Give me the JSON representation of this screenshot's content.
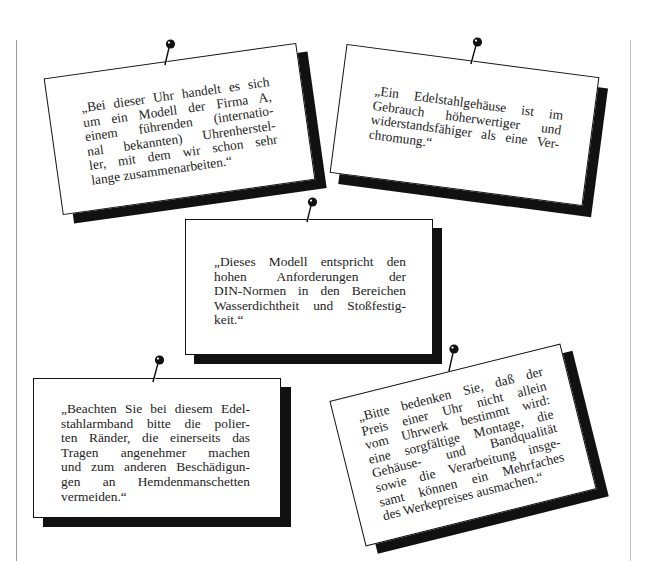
{
  "cards": [
    {
      "id": "card-1",
      "lines": [
        "„Bei dieser Uhr handelt es sich",
        "um ein Modell der Firma A,",
        "einem führenden (internatio-",
        "nal bekannten) Uhrenherstel-",
        "ler, mit dem wir schon sehr",
        "lange zusammenarbeiten.“"
      ]
    },
    {
      "id": "card-2",
      "lines": [
        "„Ein Edelstahlgehäuse ist im",
        "Gebrauch höherwertiger und",
        "widerstandsfähiger als eine Ver-",
        "chromung.“"
      ]
    },
    {
      "id": "card-3",
      "lines": [
        "„Dieses Modell entspricht den",
        "hohen Anforderungen der",
        "DIN-Normen in den Bereichen",
        "Wasserdichtheit und Stoßfestig-",
        "keit.“"
      ]
    },
    {
      "id": "card-4",
      "lines": [
        "„Beachten Sie bei diesem Edel-",
        "stahlarmband bitte die polier-",
        "ten Ränder, die einerseits das",
        "Tragen angenehmer machen",
        "und zum anderen Beschädigun-",
        "gen an Hemdenmanschetten",
        "vermeiden.“"
      ]
    },
    {
      "id": "card-5",
      "lines": [
        "„Bitte bedenken Sie, daß der",
        "Preis einer Uhr nicht allein",
        "vom Uhrwerk bestimmt wird:",
        "eine sorgfältige Montage, die",
        "Gehäuse- und Bandqualität",
        "sowie die Verarbeitung insge-",
        "samt können ein Mehrfaches",
        "des Werkepreises ausmachen.“"
      ]
    }
  ],
  "icons": {
    "pin": "push-pin-icon"
  },
  "colors": {
    "ink": "#111111",
    "paper": "#ffffff",
    "rule": "#9a9a9a"
  }
}
